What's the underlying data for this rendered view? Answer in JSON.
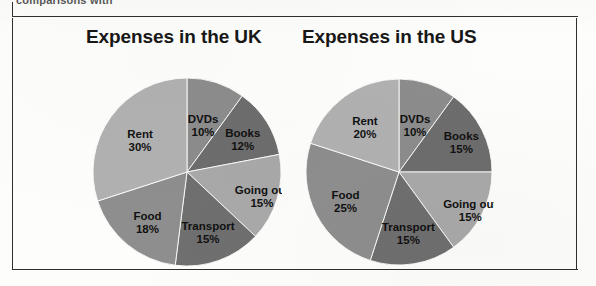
{
  "page": {
    "cropped_header_text": "comparisons with",
    "background_color": "#fdfdfb",
    "frame_color": "#2f2f2f"
  },
  "charts": [
    {
      "id": "uk",
      "title": "Expenses in the UK"
    },
    {
      "id": "us",
      "title": "Expenses in the US"
    }
  ],
  "chart_data": [
    {
      "type": "pie",
      "title": "Expenses in the UK",
      "xlabel": "",
      "ylabel": "",
      "legend": "none",
      "labels_on_slices": true,
      "start_angle_deg": 0,
      "direction": "clockwise",
      "categories": [
        "DVDs",
        "Books",
        "Going out",
        "Transport",
        "Food",
        "Rent"
      ],
      "values": [
        10,
        12,
        15,
        15,
        18,
        30
      ],
      "value_unit": "%",
      "slices": [
        {
          "label": "DVDs",
          "value": 10,
          "display": "10%",
          "color": "#8c8c8c"
        },
        {
          "label": "Books",
          "value": 12,
          "display": "12%",
          "color": "#6d6d6d"
        },
        {
          "label": "Going out",
          "value": 15,
          "display": "15%",
          "color": "#a9a9a9"
        },
        {
          "label": "Transport",
          "value": 15,
          "display": "15%",
          "color": "#6f6f6f"
        },
        {
          "label": "Food",
          "value": 18,
          "display": "18%",
          "color": "#8e8e8e"
        },
        {
          "label": "Rent",
          "value": 30,
          "display": "30%",
          "color": "#b1b1b1"
        }
      ]
    },
    {
      "type": "pie",
      "title": "Expenses in the US",
      "xlabel": "",
      "ylabel": "",
      "legend": "none",
      "labels_on_slices": true,
      "start_angle_deg": 0,
      "direction": "clockwise",
      "categories": [
        "DVDs",
        "Books",
        "Going out",
        "Transport",
        "Food",
        "Rent"
      ],
      "values": [
        10,
        15,
        15,
        15,
        25,
        20
      ],
      "value_unit": "%",
      "slices": [
        {
          "label": "DVDs",
          "value": 10,
          "display": "10%",
          "color": "#8c8c8c"
        },
        {
          "label": "Books",
          "value": 15,
          "display": "15%",
          "color": "#6d6d6d"
        },
        {
          "label": "Going out",
          "value": 15,
          "display": "15%",
          "color": "#a9a9a9"
        },
        {
          "label": "Transport",
          "value": 15,
          "display": "15%",
          "color": "#6f6f6f"
        },
        {
          "label": "Food",
          "value": 25,
          "display": "25%",
          "color": "#8e8e8e"
        },
        {
          "label": "Rent",
          "value": 20,
          "display": "20%",
          "color": "#b1b1b1"
        }
      ]
    }
  ]
}
